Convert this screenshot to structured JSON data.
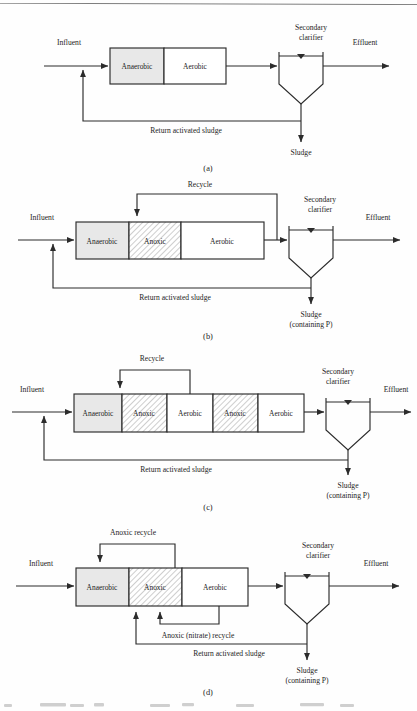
{
  "figure": {
    "type": "process-flow-diagram",
    "panels": [
      {
        "id": "a",
        "caption": "(a)",
        "zones": [
          {
            "label": "Anaerobic",
            "fill": "solid-gray"
          },
          {
            "label": "Aerobic",
            "fill": "white"
          }
        ],
        "clarifier": {
          "title_line1": "Secondary",
          "title_line2": "clarifier"
        },
        "streams": {
          "influent": "Influent",
          "effluent": "Effluent",
          "return_sludge": "Return activated sludge",
          "sludge_line1": "Sludge",
          "sludge_line2": ""
        }
      },
      {
        "id": "b",
        "caption": "(b)",
        "zones": [
          {
            "label": "Anaerobic",
            "fill": "solid-gray"
          },
          {
            "label": "Anoxic",
            "fill": "hatched"
          },
          {
            "label": "Aerobic",
            "fill": "white"
          }
        ],
        "clarifier": {
          "title_line1": "Secondary",
          "title_line2": "clarifier"
        },
        "streams": {
          "influent": "Influent",
          "effluent": "Effluent",
          "recycle": "Recycle",
          "return_sludge": "Return activated sludge",
          "sludge_line1": "Sludge",
          "sludge_line2": "(containing P)"
        }
      },
      {
        "id": "c",
        "caption": "(c)",
        "zones": [
          {
            "label": "Anaerobic",
            "fill": "solid-gray"
          },
          {
            "label": "Anoxic",
            "fill": "hatched"
          },
          {
            "label": "Aerobic",
            "fill": "white"
          },
          {
            "label": "Anoxic",
            "fill": "hatched"
          },
          {
            "label": "Aerobic",
            "fill": "white"
          }
        ],
        "clarifier": {
          "title_line1": "Secondary",
          "title_line2": "clarifier"
        },
        "streams": {
          "influent": "Influent",
          "effluent": "Effluent",
          "recycle": "Recycle",
          "return_sludge": "Return activated sludge",
          "sludge_line1": "Sludge",
          "sludge_line2": "(containing P)"
        }
      },
      {
        "id": "d",
        "caption": "(d)",
        "zones": [
          {
            "label": "Anaerobic",
            "fill": "solid-gray"
          },
          {
            "label": "Anoxic",
            "fill": "hatched"
          },
          {
            "label": "Aerobic",
            "fill": "white"
          }
        ],
        "clarifier": {
          "title_line1": "Secondary",
          "title_line2": "clarifier"
        },
        "streams": {
          "influent": "Influent",
          "effluent": "Effluent",
          "anoxic_recycle": "Anoxic recycle",
          "nitrate_recycle": "Anoxic (nitrate) recycle",
          "return_sludge": "Return activated sludge",
          "sludge_line1": "Sludge",
          "sludge_line2": "(containing P)"
        }
      }
    ]
  },
  "colors": {
    "line": "#2b2b2b",
    "anaerobic_fill": "#e8e8e8",
    "aerobic_fill": "#ffffff",
    "hatch_stroke": "#9a9a9a",
    "text": "#1d1d1d"
  }
}
